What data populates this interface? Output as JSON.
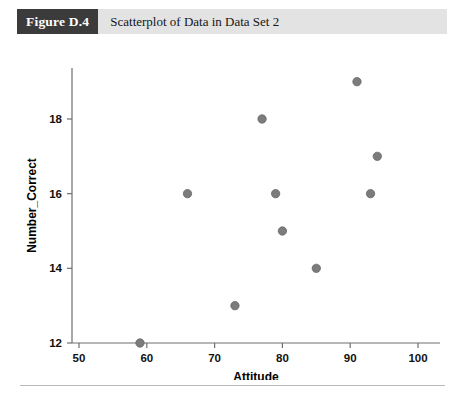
{
  "figure": {
    "badge_label": "Figure D.4",
    "caption": "Scatterplot of Data in Data Set 2"
  },
  "chart_data": {
    "type": "scatter",
    "title": "Scatterplot of Data in Data Set 2",
    "xlabel": "Attitude",
    "ylabel": "Number_Correct",
    "xlim": [
      46,
      103
    ],
    "ylim": [
      12,
      19.6
    ],
    "xticks": [
      50,
      60,
      70,
      80,
      90,
      100
    ],
    "yticks": [
      12,
      14,
      16,
      18
    ],
    "xtick_labels": [
      "50",
      "60",
      "70",
      "80",
      "90",
      "100"
    ],
    "ytick_labels": [
      "12",
      "14",
      "16",
      "18"
    ],
    "grid": false,
    "legend": null,
    "marker_color": "#7c7c7c",
    "points": [
      {
        "x": 59,
        "y": 12
      },
      {
        "x": 66,
        "y": 16
      },
      {
        "x": 73,
        "y": 13
      },
      {
        "x": 77,
        "y": 18
      },
      {
        "x": 79,
        "y": 16
      },
      {
        "x": 80,
        "y": 15
      },
      {
        "x": 85,
        "y": 14
      },
      {
        "x": 91,
        "y": 19
      },
      {
        "x": 93,
        "y": 16
      },
      {
        "x": 94,
        "y": 17
      }
    ]
  }
}
